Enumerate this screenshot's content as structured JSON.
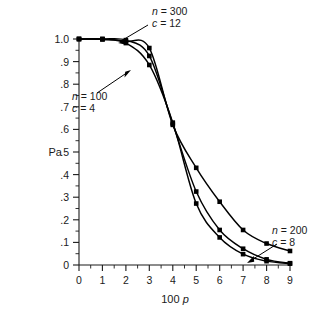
{
  "chart_data": {
    "type": "line",
    "title": "",
    "xlabel": "100 p",
    "ylabel": "Pa",
    "xlim": [
      0,
      9
    ],
    "ylim": [
      0,
      1.0
    ],
    "grid": false,
    "legend_position": "inline-annotations",
    "x_ticks": [
      "0",
      "1",
      "2",
      "3",
      "4",
      "5",
      "6",
      "7",
      "8",
      "9"
    ],
    "x_tick_values": [
      0,
      1,
      2,
      3,
      4,
      5,
      6,
      7,
      8,
      9
    ],
    "y_ticks": [
      "0",
      ".1",
      ".2",
      ".3",
      ".4",
      ".5",
      ".6",
      ".7",
      ".8",
      ".9",
      "1.0"
    ],
    "y_tick_values": [
      0,
      0.1,
      0.2,
      0.3,
      0.4,
      0.5,
      0.6,
      0.7,
      0.8,
      0.9,
      1.0
    ],
    "x": [
      0,
      1,
      2,
      3,
      4,
      5,
      6,
      7,
      8,
      9
    ],
    "series": [
      {
        "name": "n = 200, c = 8",
        "n": 200,
        "c": 8,
        "values": [
          1.0,
          1.0,
          0.99,
          0.96,
          0.62,
          0.43,
          0.28,
          0.155,
          0.095,
          0.062
        ]
      },
      {
        "name": "n = 300, c = 12",
        "n": 300,
        "c": 12,
        "values": [
          1.0,
          1.0,
          0.995,
          0.925,
          0.625,
          0.325,
          0.155,
          0.072,
          0.025,
          0.008
        ]
      },
      {
        "name": "n = 100, c = 4",
        "n": 100,
        "c": 4,
        "values": [
          1.0,
          0.998,
          0.982,
          0.885,
          0.63,
          0.272,
          0.122,
          0.048,
          0.017,
          0.006
        ]
      }
    ],
    "annotations": [
      {
        "id": "annot-n300",
        "line1_var": "n",
        "line1_text": " = 300",
        "line2_var": "c",
        "line2_text": " = 12",
        "points_to_series": "n = 300, c = 12"
      },
      {
        "id": "annot-n100",
        "line1_var": "n",
        "line1_text": " = 100",
        "line2_var": "c",
        "line2_text": " = 4",
        "points_to_series": "n = 100, c = 4"
      },
      {
        "id": "annot-n200",
        "line1_var": "n",
        "line1_text": " = 200",
        "line2_var": "c",
        "line2_text": " = 8",
        "points_to_series": "n = 200, c = 8"
      }
    ],
    "axis_title_x_prefix": "100 ",
    "axis_title_x_var": "p",
    "colors": {
      "curve": "#000000",
      "axis": "#1a1a1a",
      "background": "#ffffff"
    }
  }
}
